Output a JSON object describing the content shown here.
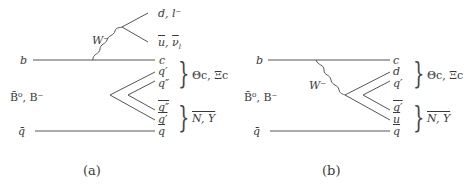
{
  "diagram_a": {
    "caption": "(a)",
    "initial_top": "b",
    "initial_meson": "B̄⁰, B⁻",
    "initial_bottom": "q̄",
    "boson": "W⁻",
    "decay_top": "d, l⁻",
    "decay_bottom_u": "u",
    "decay_bottom_nu": "ν",
    "decay_bottom_nu_sub": "l",
    "out_1": "c",
    "out_2": "q′",
    "out_3": "q″",
    "out_4": "q″",
    "out_5": "q′",
    "out_6": "q",
    "baryon_top": "Θc, Ξc",
    "baryon_bottom": "N, Y"
  },
  "diagram_b": {
    "caption": "(b)",
    "initial_top": "b",
    "initial_meson": "B̄⁰, B⁻",
    "initial_bottom": "q̄",
    "boson": "W⁻",
    "out_1": "c",
    "out_2": "d",
    "out_3": "q′",
    "out_4": "q′",
    "out_5": "u",
    "out_6": "q",
    "baryon_top": "Θc, Ξc",
    "baryon_bottom": "N, Y"
  }
}
